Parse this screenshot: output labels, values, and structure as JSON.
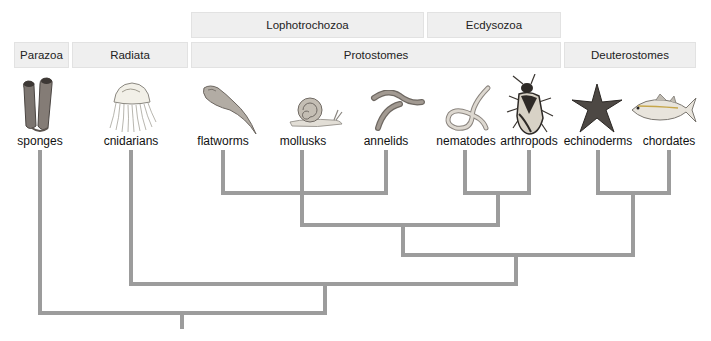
{
  "groups_top": [
    {
      "id": "lophotrochozoa",
      "label": "Lophotrochozoa"
    },
    {
      "id": "ecdysozoa",
      "label": "Ecdysozoa"
    }
  ],
  "groups_main": [
    {
      "id": "parazoa",
      "label": "Parazoa"
    },
    {
      "id": "radiata",
      "label": "Radiata"
    },
    {
      "id": "protostomes",
      "label": "Protostomes"
    },
    {
      "id": "deuterostomes",
      "label": "Deuterostomes"
    }
  ],
  "taxa": [
    {
      "id": "sponges",
      "label": "sponges",
      "icon": "sponge-icon"
    },
    {
      "id": "cnidarians",
      "label": "cnidarians",
      "icon": "jellyfish-icon"
    },
    {
      "id": "flatworms",
      "label": "flatworms",
      "icon": "flatworm-icon"
    },
    {
      "id": "mollusks",
      "label": "mollusks",
      "icon": "snail-icon"
    },
    {
      "id": "annelids",
      "label": "annelids",
      "icon": "earthworm-icon"
    },
    {
      "id": "nematodes",
      "label": "nematodes",
      "icon": "roundworm-icon"
    },
    {
      "id": "arthropods",
      "label": "arthropods",
      "icon": "beetle-icon"
    },
    {
      "id": "echinoderms",
      "label": "echinoderms",
      "icon": "starfish-icon"
    },
    {
      "id": "chordates",
      "label": "chordates",
      "icon": "fish-icon"
    }
  ],
  "tree": {
    "line_color": "#9c9c9c",
    "clades": [
      {
        "name": "lophotrochozoa",
        "members": [
          "flatworms",
          "mollusks",
          "annelids"
        ]
      },
      {
        "name": "ecdysozoa",
        "members": [
          "nematodes",
          "arthropods"
        ]
      },
      {
        "name": "protostomes",
        "members": [
          "lophotrochozoa",
          "ecdysozoa"
        ]
      },
      {
        "name": "deuterostomes",
        "members": [
          "echinoderms",
          "chordates"
        ]
      },
      {
        "name": "bilateria",
        "members": [
          "protostomes",
          "deuterostomes"
        ]
      },
      {
        "name": "eumetazoa",
        "members": [
          "cnidarians",
          "bilateria"
        ]
      },
      {
        "name": "animalia",
        "members": [
          "sponges",
          "eumetazoa"
        ]
      }
    ]
  }
}
